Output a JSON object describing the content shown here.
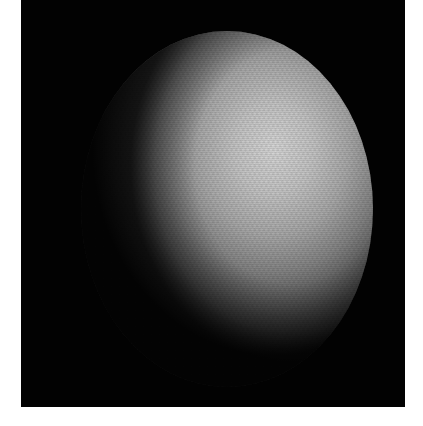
{
  "image": {
    "subject": "planet-disk",
    "description": "Grayscale photograph of a planet's partially illuminated disk against a black background, lit from the upper right",
    "background_color": "#020202",
    "page_color": "#ffffff",
    "highlight_color": "#d6d6d6",
    "shadow_color": "#0c0c0c"
  },
  "caption": {
    "text": ""
  }
}
